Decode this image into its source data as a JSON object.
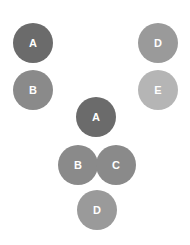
{
  "groups": [
    {
      "name": "left-column",
      "nodes": [
        {
          "label": "A",
          "cx": 33,
          "cy": 43,
          "color": "#6b6b6b"
        },
        {
          "label": "B",
          "cx": 33,
          "cy": 90,
          "color": "#8a8a8a"
        }
      ]
    },
    {
      "name": "right-column",
      "nodes": [
        {
          "label": "D",
          "cx": 158,
          "cy": 43,
          "color": "#9a9a9a"
        },
        {
          "label": "E",
          "cx": 158,
          "cy": 90,
          "color": "#b5b5b5"
        }
      ]
    },
    {
      "name": "center-cluster",
      "nodes": [
        {
          "label": "A",
          "cx": 96,
          "cy": 117,
          "color": "#6b6b6b"
        },
        {
          "label": "B",
          "cx": 78,
          "cy": 165,
          "color": "#8a8a8a"
        },
        {
          "label": "C",
          "cx": 116,
          "cy": 165,
          "color": "#8a8a8a"
        },
        {
          "label": "D",
          "cx": 97,
          "cy": 210,
          "color": "#9a9a9a"
        }
      ]
    }
  ]
}
